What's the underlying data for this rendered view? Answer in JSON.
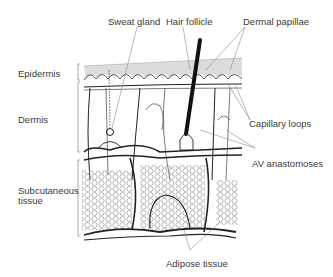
{
  "diagram": {
    "type": "skin-cross-section",
    "layer_labels": {
      "epidermis": "Epidermis",
      "dermis": "Dermis",
      "subcutaneous_line1": "Subcutaneous",
      "subcutaneous_line2": "tissue"
    },
    "structure_labels": {
      "sweat_gland": "Sweat gland",
      "hair_follicle": "Hair follicle",
      "dermal_papillae": "Dermal papillae",
      "capillary_loops": "Capillary loops",
      "av_anastomoses": "AV anastomoses",
      "adipose_tissue": "Adipose tissue"
    },
    "colors": {
      "epidermis_fill": "#dcdcdc",
      "line": "#222222",
      "leader": "#8a8a8a",
      "text": "#3a3a3a"
    }
  }
}
